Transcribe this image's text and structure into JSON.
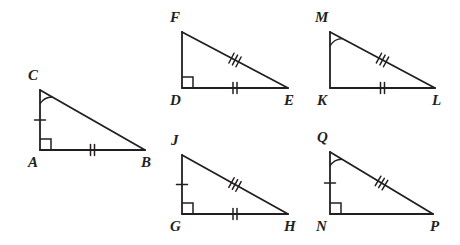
{
  "figure": {
    "kind": "congruent-right-triangles-diagram",
    "background_color": "#ffffff",
    "stroke_color": "#231f20",
    "width": 460,
    "height": 245,
    "triangles": [
      {
        "id": "triangle-cab",
        "name": "triangle-CAB",
        "vertices": {
          "apex": {
            "label": "C",
            "x": 40,
            "y": 90,
            "label_x": 28,
            "label_y": 80
          },
          "right": {
            "label": "A",
            "x": 40,
            "y": 150,
            "label_x": 28,
            "label_y": 167
          },
          "far": {
            "label": "B",
            "x": 145,
            "y": 150,
            "label_x": 141,
            "label_y": 167
          }
        },
        "marks": {
          "angle_arc_at_apex": true,
          "right_angle_at_corner": true,
          "vertical_ticks": 1,
          "base_ticks": 2,
          "hypotenuse_ticks": 0
        }
      },
      {
        "id": "triangle-fde",
        "name": "triangle-FDE",
        "vertices": {
          "apex": {
            "label": "F",
            "x": 182,
            "y": 32,
            "label_x": 170,
            "label_y": 22
          },
          "right": {
            "label": "D",
            "x": 182,
            "y": 88,
            "label_x": 170,
            "label_y": 105
          },
          "far": {
            "label": "E",
            "x": 288,
            "y": 88,
            "label_x": 284,
            "label_y": 105
          }
        },
        "marks": {
          "angle_arc_at_apex": false,
          "right_angle_at_corner": true,
          "vertical_ticks": 0,
          "base_ticks": 2,
          "hypotenuse_ticks": 3
        }
      },
      {
        "id": "triangle-mkl",
        "name": "triangle-MKL",
        "vertices": {
          "apex": {
            "label": "M",
            "x": 330,
            "y": 32,
            "label_x": 315,
            "label_y": 22
          },
          "right": {
            "label": "K",
            "x": 330,
            "y": 88,
            "label_x": 317,
            "label_y": 105
          },
          "far": {
            "label": "L",
            "x": 435,
            "y": 88,
            "label_x": 432,
            "label_y": 105
          }
        },
        "marks": {
          "angle_arc_at_apex": true,
          "right_angle_at_corner": false,
          "vertical_ticks": 0,
          "base_ticks": 2,
          "hypotenuse_ticks": 3
        }
      },
      {
        "id": "triangle-jgh",
        "name": "triangle-JGH",
        "vertices": {
          "apex": {
            "label": "J",
            "x": 182,
            "y": 155,
            "label_x": 171,
            "label_y": 145
          },
          "right": {
            "label": "G",
            "x": 182,
            "y": 214,
            "label_x": 170,
            "label_y": 231
          },
          "far": {
            "label": "H",
            "x": 288,
            "y": 214,
            "label_x": 284,
            "label_y": 231
          }
        },
        "marks": {
          "angle_arc_at_apex": false,
          "right_angle_at_corner": true,
          "vertical_ticks": 1,
          "base_ticks": 2,
          "hypotenuse_ticks": 3
        }
      },
      {
        "id": "triangle-qnp",
        "name": "triangle-QNP",
        "vertices": {
          "apex": {
            "label": "Q",
            "x": 330,
            "y": 152,
            "label_x": 317,
            "label_y": 142
          },
          "right": {
            "label": "N",
            "x": 330,
            "y": 214,
            "label_x": 316,
            "label_y": 231
          },
          "far": {
            "label": "P",
            "x": 433,
            "y": 214,
            "label_x": 430,
            "label_y": 231
          }
        },
        "marks": {
          "angle_arc_at_apex": true,
          "right_angle_at_corner": true,
          "vertical_ticks": 1,
          "base_ticks": 0,
          "hypotenuse_ticks": 3
        }
      }
    ]
  }
}
